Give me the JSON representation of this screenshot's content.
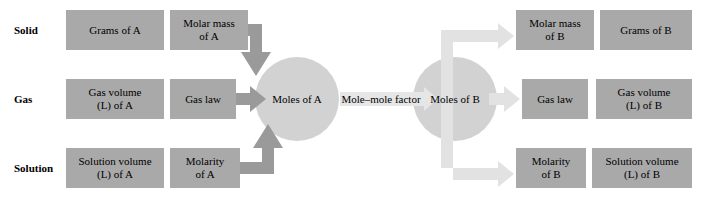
{
  "diagram": {
    "colors": {
      "box_fill": "#a9a9a9",
      "circle_fill": "#d2d2d2",
      "arrow_dark": "#9a9a9a",
      "arrow_light": "#e2e2e2",
      "background": "#ffffff",
      "text": "#000000"
    },
    "row_labels": [
      {
        "id": "solid",
        "text": "Solid"
      },
      {
        "id": "gas",
        "text": "Gas"
      },
      {
        "id": "solution",
        "text": "Solution"
      }
    ],
    "hubs": [
      {
        "id": "moles-of-a",
        "label": "Moles of A"
      },
      {
        "id": "moles-of-b",
        "label": "Moles of B"
      }
    ],
    "center_connector": {
      "id": "mole-mole-factor",
      "label": "Mole–mole factor"
    },
    "left_side": {
      "solid": [
        {
          "id": "grams-of-a",
          "line1": "Grams of A",
          "line2": ""
        },
        {
          "id": "molar-mass-of-a",
          "line1": "Molar mass",
          "line2": "of A"
        }
      ],
      "gas": [
        {
          "id": "gas-volume-of-a",
          "line1": "Gas volume",
          "line2": "(L) of A"
        },
        {
          "id": "gas-law-a",
          "line1": "Gas law",
          "line2": ""
        }
      ],
      "solution": [
        {
          "id": "solution-volume-of-a",
          "line1": "Solution volume",
          "line2": "(L) of A"
        },
        {
          "id": "molarity-of-a",
          "line1": "Molarity",
          "line2": "of A"
        }
      ]
    },
    "right_side": {
      "solid": [
        {
          "id": "molar-mass-of-b",
          "line1": "Molar mass",
          "line2": "of B"
        },
        {
          "id": "grams-of-b",
          "line1": "Grams of B",
          "line2": ""
        }
      ],
      "gas": [
        {
          "id": "gas-law-b",
          "line1": "Gas law",
          "line2": ""
        },
        {
          "id": "gas-volume-of-b",
          "line1": "Gas volume",
          "line2": "(L) of B"
        }
      ],
      "solution": [
        {
          "id": "molarity-of-b",
          "line1": "Molarity",
          "line2": "of B"
        },
        {
          "id": "solution-volume-of-b",
          "line1": "Solution volume",
          "line2": "(L) of B"
        }
      ]
    }
  }
}
